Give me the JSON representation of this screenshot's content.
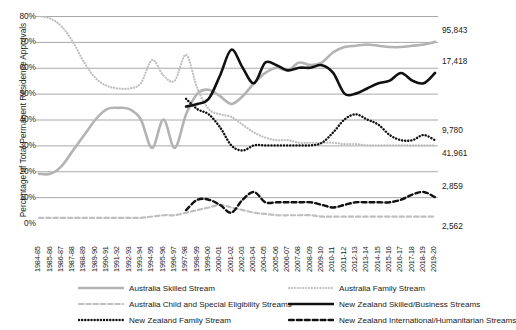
{
  "chart_data": {
    "type": "line",
    "title": "",
    "xlabel": "",
    "ylabel": "Percentage of Total Permanent Residence Approvals",
    "ylim": [
      0,
      80
    ],
    "ytick_labels": [
      "0%",
      "10%",
      "20%",
      "30%",
      "40%",
      "50%",
      "60%",
      "70%",
      "80%"
    ],
    "ytick_values": [
      0,
      10,
      20,
      30,
      40,
      50,
      60,
      70,
      80
    ],
    "grid": true,
    "legend_position": "bottom",
    "categories": [
      "1984-85",
      "1985-86",
      "1986-87",
      "1987-88",
      "1988-89",
      "1989-90",
      "1990-91",
      "1991-92",
      "1992-93",
      "1993-94",
      "1994-95",
      "1995-96",
      "1996-97",
      "1997-98",
      "1998-99",
      "1999-00",
      "2000-01",
      "2001-02",
      "2002-03",
      "2003-04",
      "2004-05",
      "2005-06",
      "2006-07",
      "2007-08",
      "2008-09",
      "2009-10",
      "2010-11",
      "2011-12",
      "2012-13",
      "2013-14",
      "2014-15",
      "2015-16",
      "2016-17",
      "2017-18",
      "2018-19",
      "2019-20"
    ],
    "series": [
      {
        "name": "Australia Skilled Stream",
        "style": "solid",
        "color": "#b3b3b3",
        "end_label": "95,843",
        "values": [
          19,
          19,
          22,
          28,
          34,
          40,
          44,
          44.5,
          44,
          40,
          29,
          40,
          29,
          42,
          50,
          51.5,
          49,
          46,
          49,
          54,
          58,
          60,
          59,
          62,
          61,
          62,
          66,
          68,
          68.5,
          69,
          68.5,
          68,
          68,
          68.5,
          69,
          70
        ]
      },
      {
        "name": "Australia Family Stream",
        "style": "dotted",
        "color": "#bfbfbf",
        "end_label": "41,961",
        "values": [
          80,
          79,
          76,
          70,
          62,
          56,
          53,
          52,
          52,
          54,
          63,
          57,
          55,
          65,
          52,
          44,
          42,
          41,
          38,
          35,
          33,
          32,
          32,
          31,
          31,
          31,
          31,
          30.5,
          30.5,
          30,
          30,
          30,
          30,
          30,
          30,
          30
        ]
      },
      {
        "name": "Australia Child and Special Eligibility Streams",
        "style": "dashed",
        "color": "#bfbfbf",
        "end_label": "2,562",
        "values": [
          2,
          2,
          2,
          2,
          2,
          2,
          2,
          2,
          2,
          2,
          2.5,
          3,
          3,
          4,
          5,
          6,
          7,
          6,
          5,
          4,
          3.5,
          3,
          3,
          3,
          3,
          2.5,
          2.5,
          2.5,
          2.5,
          2.5,
          2.5,
          2.5,
          2.5,
          2.5,
          2.5,
          2.5
        ]
      },
      {
        "name": "New Zealand Skilled/Business Streams",
        "style": "solid",
        "color": "#111111",
        "end_label": "17,418",
        "values": [
          null,
          null,
          null,
          null,
          null,
          null,
          null,
          null,
          null,
          null,
          null,
          null,
          null,
          45,
          46,
          48,
          57,
          67,
          60,
          54,
          62,
          61,
          59,
          60,
          60,
          61,
          58,
          50,
          50,
          52,
          54,
          55,
          58,
          55,
          54,
          58
        ]
      },
      {
        "name": "New Zealand Family Stream",
        "style": "dotted",
        "color": "#111111",
        "end_label": "9,780",
        "values": [
          null,
          null,
          null,
          null,
          null,
          null,
          null,
          null,
          null,
          null,
          null,
          null,
          null,
          48,
          44,
          42,
          37,
          30,
          28,
          30,
          30,
          30,
          30,
          30,
          30,
          31,
          35,
          40,
          42,
          40,
          38,
          34,
          32,
          32,
          34,
          32
        ]
      },
      {
        "name": "New Zealand International/Humanitarian Streams",
        "style": "dashed",
        "color": "#111111",
        "end_label": "2,859",
        "values": [
          null,
          null,
          null,
          null,
          null,
          null,
          null,
          null,
          null,
          null,
          null,
          null,
          null,
          5,
          9,
          9,
          7,
          4,
          9,
          12,
          8,
          8,
          8,
          8,
          8,
          7,
          6,
          7,
          8,
          8,
          8,
          8,
          9,
          11,
          12,
          10
        ]
      }
    ],
    "end_value_labels": [
      {
        "text": "95,843",
        "series": "Australia Skilled Stream"
      },
      {
        "text": "17,418",
        "series": "New Zealand Skilled/Business Streams"
      },
      {
        "text": "9,780",
        "series": "New Zealand Family Stream"
      },
      {
        "text": "41,961",
        "series": "Australia Family Stream"
      },
      {
        "text": "2,859",
        "series": "New Zealand International/Humanitarian Streams"
      },
      {
        "text": "2,562",
        "series": "Australia Child and Special Eligibility Streams"
      }
    ]
  }
}
